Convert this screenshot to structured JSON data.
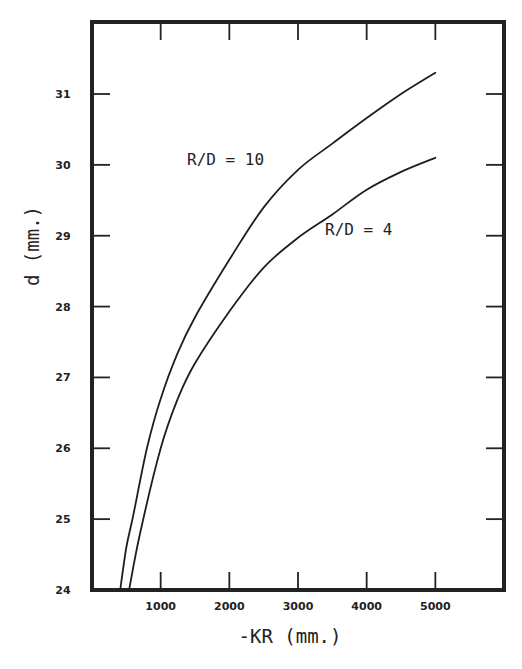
{
  "chart_data": {
    "type": "line",
    "title": "",
    "xlabel": "-KR (mm.)",
    "ylabel": "d (mm.)",
    "xlim": [
      0,
      6000
    ],
    "ylim": [
      24,
      32
    ],
    "grid": false,
    "legend": "inline annotations",
    "x_ticks": [
      1000,
      2000,
      3000,
      4000,
      5000
    ],
    "x_tick_labels": [
      "1000",
      "2000",
      "3000",
      "4000",
      "5000"
    ],
    "y_ticks": [
      24,
      25,
      26,
      27,
      28,
      29,
      30,
      31
    ],
    "y_tick_labels": [
      "24",
      "25",
      "26",
      "27",
      "28",
      "29",
      "30",
      "31"
    ],
    "series": [
      {
        "name": "R/D = 10",
        "x": [
          410,
          500,
          600,
          800,
          1000,
          1250,
          1500,
          2000,
          2500,
          3000,
          3500,
          4000,
          4500,
          5000
        ],
        "y": [
          24.0,
          24.6,
          25.05,
          26.0,
          26.7,
          27.35,
          27.85,
          28.66,
          29.4,
          29.93,
          30.3,
          30.66,
          31.0,
          31.3
        ]
      },
      {
        "name": "R/D = 4",
        "x": [
          540,
          700,
          1000,
          1250,
          1500,
          2000,
          2500,
          3000,
          3500,
          4000,
          4500,
          5000
        ],
        "y": [
          24.0,
          24.8,
          26.0,
          26.7,
          27.2,
          27.93,
          28.55,
          28.97,
          29.3,
          29.65,
          29.9,
          30.1
        ]
      }
    ],
    "annotations": [
      {
        "text": "R/D = 10",
        "x": 1400,
        "y": 30.1
      },
      {
        "text": "R/D = 4",
        "x": 3400,
        "y": 29.1
      }
    ]
  },
  "labels": {
    "xlabel": "-KR (mm.)",
    "ylabel": "d (mm.)",
    "curve_10": "R/D = 10",
    "curve_4": "R/D = 4"
  },
  "style": {
    "line_color": "#1e1e1e",
    "background": "#ffffff"
  }
}
